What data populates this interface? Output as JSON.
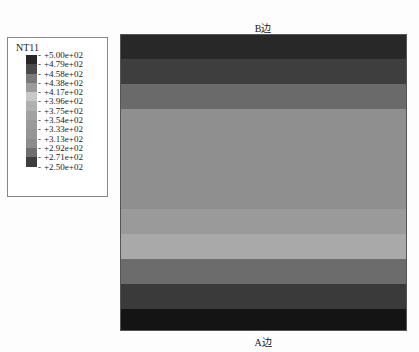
{
  "legend": {
    "title": "NT11",
    "labels": [
      "+5.00e+02",
      "+4.79e+02",
      "+4.58e+02",
      "+4.38e+02",
      "+4.17e+02",
      "+3.96e+02",
      "+3.75e+02",
      "+3.54e+02",
      "+3.33e+02",
      "+3.13e+02",
      "+2.92e+02",
      "+2.71e+02",
      "+2.50e+02"
    ],
    "swatch_colors": [
      "#262626",
      "#4a4a4a",
      "#7a7a7a",
      "#9c9c9c",
      "#c8c8c8",
      "#b0b0b0",
      "#a2a2a2",
      "#9a9a9a",
      "#959595",
      "#8c8c8c",
      "#6e6e6e",
      "#3e3e3e",
      "#2a2a2a"
    ]
  },
  "plot": {
    "top_label": "B边",
    "bottom_label": "A边",
    "bands": [
      {
        "top": 0,
        "height": 24,
        "color": "#282828"
      },
      {
        "top": 24,
        "height": 25,
        "color": "#3e3e3e"
      },
      {
        "top": 49,
        "height": 25,
        "color": "#6a6a6a"
      },
      {
        "top": 74,
        "height": 100,
        "color": "#8f8f8f"
      },
      {
        "top": 174,
        "height": 25,
        "color": "#9a9a9a"
      },
      {
        "top": 199,
        "height": 25,
        "color": "#a9a9a9"
      },
      {
        "top": 224,
        "height": 25,
        "color": "#6c6c6c"
      },
      {
        "top": 249,
        "height": 25,
        "color": "#3a3a3a"
      },
      {
        "top": 274,
        "height": 23,
        "color": "#141414"
      }
    ]
  },
  "chart_data": {
    "type": "heatmap",
    "title": "NT11",
    "colorbar": {
      "min": 250,
      "max": 500,
      "ticks": [
        500,
        479,
        458,
        438,
        417,
        396,
        375,
        354,
        333,
        313,
        292,
        271,
        250
      ]
    },
    "top_edge_label": "B边",
    "bottom_edge_label": "A边"
  }
}
